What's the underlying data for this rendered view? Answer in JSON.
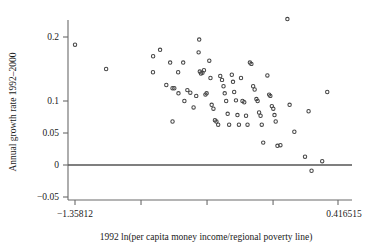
{
  "chart_data": {
    "type": "scatter",
    "title": "",
    "xlabel": "1992 ln(per capita money income/regional poverty line)",
    "ylabel": "Annual growth rate 1992–2000",
    "xlim": [
      -1.35812,
      0.416515
    ],
    "ylim": [
      -0.05,
      0.23
    ],
    "grid": false,
    "legend": null,
    "x_end_labels": [
      "-1.35812",
      "0.416515"
    ],
    "x_tick_values": [
      -1.35812,
      -0.91264,
      -0.46716,
      -0.02168,
      0.41651
    ],
    "y_tick_labels": [
      "0.2",
      "0.1",
      "0.05",
      "0",
      "-0.05"
    ],
    "y_tick_values": [
      0.2,
      0.1,
      0.05,
      0,
      -0.05
    ],
    "reference_line": {
      "type": "horizontal",
      "y": 0,
      "color": "#555555"
    },
    "marker": {
      "shape": "circle-open",
      "color": "#444444",
      "size": 3.4
    },
    "points": [
      {
        "x": -1.358,
        "y": 0.188
      },
      {
        "x": -1.148,
        "y": 0.15
      },
      {
        "x": -0.831,
        "y": 0.17
      },
      {
        "x": -0.784,
        "y": 0.18
      },
      {
        "x": -0.832,
        "y": 0.145
      },
      {
        "x": -0.742,
        "y": 0.125
      },
      {
        "x": -0.7,
        "y": 0.12
      },
      {
        "x": -0.688,
        "y": 0.12
      },
      {
        "x": -0.716,
        "y": 0.16
      },
      {
        "x": -0.662,
        "y": 0.145
      },
      {
        "x": -0.66,
        "y": 0.112
      },
      {
        "x": -0.7,
        "y": 0.068
      },
      {
        "x": -0.628,
        "y": 0.16
      },
      {
        "x": -0.62,
        "y": 0.1
      },
      {
        "x": -0.6,
        "y": 0.117
      },
      {
        "x": -0.58,
        "y": 0.113
      },
      {
        "x": -0.558,
        "y": 0.09
      },
      {
        "x": -0.54,
        "y": 0.108
      },
      {
        "x": -0.52,
        "y": 0.196
      },
      {
        "x": -0.524,
        "y": 0.176
      },
      {
        "x": -0.516,
        "y": 0.146
      },
      {
        "x": -0.508,
        "y": 0.143
      },
      {
        "x": -0.498,
        "y": 0.144
      },
      {
        "x": -0.488,
        "y": 0.148
      },
      {
        "x": -0.478,
        "y": 0.11
      },
      {
        "x": -0.47,
        "y": 0.112
      },
      {
        "x": -0.452,
        "y": 0.163
      },
      {
        "x": -0.444,
        "y": 0.136
      },
      {
        "x": -0.436,
        "y": 0.094
      },
      {
        "x": -0.424,
        "y": 0.088
      },
      {
        "x": -0.414,
        "y": 0.07
      },
      {
        "x": -0.404,
        "y": 0.068
      },
      {
        "x": -0.392,
        "y": 0.063
      },
      {
        "x": -0.378,
        "y": 0.139
      },
      {
        "x": -0.366,
        "y": 0.133
      },
      {
        "x": -0.356,
        "y": 0.123
      },
      {
        "x": -0.348,
        "y": 0.112
      },
      {
        "x": -0.338,
        "y": 0.1
      },
      {
        "x": -0.328,
        "y": 0.08
      },
      {
        "x": -0.318,
        "y": 0.063
      },
      {
        "x": -0.3,
        "y": 0.141
      },
      {
        "x": -0.292,
        "y": 0.13
      },
      {
        "x": -0.284,
        "y": 0.114
      },
      {
        "x": -0.272,
        "y": 0.101
      },
      {
        "x": -0.262,
        "y": 0.078
      },
      {
        "x": -0.252,
        "y": 0.063
      },
      {
        "x": -0.238,
        "y": 0.136
      },
      {
        "x": -0.228,
        "y": 0.1
      },
      {
        "x": -0.216,
        "y": 0.098
      },
      {
        "x": -0.204,
        "y": 0.077
      },
      {
        "x": -0.194,
        "y": 0.063
      },
      {
        "x": -0.178,
        "y": 0.16
      },
      {
        "x": -0.168,
        "y": 0.158
      },
      {
        "x": -0.156,
        "y": 0.123
      },
      {
        "x": -0.146,
        "y": 0.118
      },
      {
        "x": -0.134,
        "y": 0.103
      },
      {
        "x": -0.126,
        "y": 0.1
      },
      {
        "x": -0.116,
        "y": 0.082
      },
      {
        "x": -0.106,
        "y": 0.077
      },
      {
        "x": -0.098,
        "y": 0.063
      },
      {
        "x": -0.088,
        "y": 0.035
      },
      {
        "x": -0.06,
        "y": 0.14
      },
      {
        "x": -0.048,
        "y": 0.11
      },
      {
        "x": -0.04,
        "y": 0.108
      },
      {
        "x": -0.03,
        "y": 0.092
      },
      {
        "x": -0.02,
        "y": 0.088
      },
      {
        "x": -0.012,
        "y": 0.078
      },
      {
        "x": -0.004,
        "y": 0.068
      },
      {
        "x": 0.008,
        "y": 0.03
      },
      {
        "x": 0.028,
        "y": 0.031
      },
      {
        "x": 0.075,
        "y": 0.228
      },
      {
        "x": 0.09,
        "y": 0.094
      },
      {
        "x": 0.122,
        "y": 0.052
      },
      {
        "x": 0.194,
        "y": 0.013
      },
      {
        "x": 0.218,
        "y": 0.084
      },
      {
        "x": 0.238,
        "y": -0.009
      },
      {
        "x": 0.31,
        "y": 0.006
      },
      {
        "x": 0.344,
        "y": 0.114
      }
    ]
  }
}
